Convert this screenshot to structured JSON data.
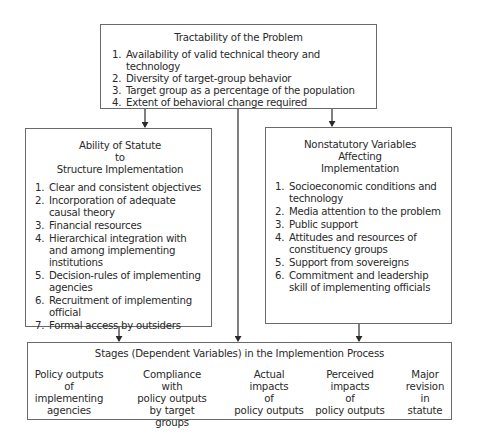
{
  "boxes": {
    "tractability": {
      "title": "Tractability of the Problem",
      "items": [
        {
          "num": "1.",
          "text": "Availability of valid technical theory and technology"
        },
        {
          "num": "2.",
          "text": "Diversity of target-group behavior"
        },
        {
          "num": "3.",
          "text": "Target group as a percentage of the population"
        },
        {
          "num": "4.",
          "text": "Extent of behavioral change required"
        }
      ]
    },
    "statute": {
      "title_lines": [
        "Ability of Statute",
        "to",
        "Structure Implementation"
      ],
      "items": [
        {
          "num": "1.",
          "text": "Clear and consistent  objectives"
        },
        {
          "num": "2.",
          "text": "Incorporation of adequate causal theory"
        },
        {
          "num": "3.",
          "text": "Financial resources"
        },
        {
          "num": "4.",
          "text": "Hierarchical integration with and among implementing institutions"
        },
        {
          "num": "5.",
          "text": "Decision-rules of implementing agencies"
        },
        {
          "num": "6.",
          "text": "Recruitment of implementing official"
        },
        {
          "num": "7.",
          "text": "Formal access by outsiders"
        }
      ]
    },
    "nonstatutory": {
      "title_lines": [
        "Nonstatutory Variables",
        "Affecting",
        "Implementation"
      ],
      "items": [
        {
          "num": "1.",
          "text": "Socioeconomic conditions and technology"
        },
        {
          "num": "2.",
          "text": "Media attention to the problem"
        },
        {
          "num": "3.",
          "text": "Public support"
        },
        {
          "num": "4.",
          "text": "Attitudes and resources of constituency groups"
        },
        {
          "num": "5.",
          "text": "Support from sovereigns"
        },
        {
          "num": "6.",
          "text": "Commitment and leadership skill of implementing officials"
        }
      ]
    },
    "stages": {
      "title": "Stages (Dependent Variables) in the Implemention Process",
      "steps": [
        {
          "lines": [
            "Policy outputs",
            "of",
            "implementing",
            "agencies"
          ]
        },
        {
          "lines": [
            "Compliance with",
            "policy outputs",
            "by target",
            "groups"
          ]
        },
        {
          "lines": [
            "Actual",
            "impacts",
            "of",
            "policy outputs"
          ]
        },
        {
          "lines": [
            "Perceived",
            "impacts",
            "of",
            "policy outputs"
          ]
        },
        {
          "lines": [
            "Major",
            "revision",
            "in",
            "statute"
          ]
        }
      ]
    }
  },
  "colors": {
    "line": "#2a2a2a",
    "border": "#6a6a6a"
  }
}
